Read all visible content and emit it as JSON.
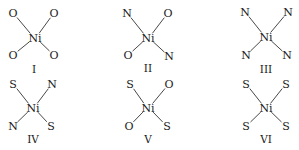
{
  "diagram": {
    "central_atom": "Ni",
    "complexes": [
      {
        "label": "I",
        "center": [
          35,
          38
        ],
        "ligands": {
          "top_left": "O",
          "top_right": "O",
          "bottom_left": "O",
          "bottom_right": "O"
        },
        "ligand_pos": {
          "top_left": [
            13,
            17
          ],
          "top_right": [
            54,
            17
          ],
          "bottom_left": [
            13,
            59
          ],
          "bottom_right": [
            54,
            59
          ]
        },
        "label_pos": [
          34,
          73
        ]
      },
      {
        "label": "II",
        "center": [
          148,
          38
        ],
        "ligands": {
          "top_left": "N",
          "top_right": "O",
          "bottom_left": "O",
          "bottom_right": "N"
        },
        "ligand_pos": {
          "top_left": [
            127,
            17
          ],
          "top_right": [
            168,
            17
          ],
          "bottom_left": [
            128,
            59
          ],
          "bottom_right": [
            169,
            60
          ]
        },
        "label_pos": [
          148,
          72
        ]
      },
      {
        "label": "III",
        "center": [
          266,
          37
        ],
        "ligands": {
          "top_left": "N",
          "top_right": "N",
          "bottom_left": "N",
          "bottom_right": "N"
        },
        "ligand_pos": {
          "top_left": [
            245,
            16
          ],
          "top_right": [
            288,
            16
          ],
          "bottom_left": [
            246,
            59
          ],
          "bottom_right": [
            287,
            59
          ]
        },
        "label_pos": [
          266,
          73
        ]
      },
      {
        "label": "IV",
        "center": [
          33,
          108
        ],
        "ligands": {
          "top_left": "S",
          "top_right": "N",
          "bottom_left": "N",
          "bottom_right": "S"
        },
        "ligand_pos": {
          "top_left": [
            13,
            88
          ],
          "top_right": [
            52,
            88
          ],
          "bottom_left": [
            13,
            130
          ],
          "bottom_right": [
            51,
            130
          ]
        },
        "label_pos": [
          33,
          143
        ]
      },
      {
        "label": "V",
        "center": [
          148,
          108
        ],
        "ligands": {
          "top_left": "S",
          "top_right": "O",
          "bottom_left": "O",
          "bottom_right": "S"
        },
        "ligand_pos": {
          "top_left": [
            130,
            88
          ],
          "top_right": [
            169,
            88
          ],
          "bottom_left": [
            129,
            130
          ],
          "bottom_right": [
            167,
            130
          ]
        },
        "label_pos": [
          148,
          143
        ]
      },
      {
        "label": "VI",
        "center": [
          266,
          108
        ],
        "ligands": {
          "top_left": "S",
          "top_right": "S",
          "bottom_left": "S",
          "bottom_right": "S"
        },
        "ligand_pos": {
          "top_left": [
            246,
            88
          ],
          "top_right": [
            286,
            88
          ],
          "bottom_left": [
            246,
            130
          ],
          "bottom_right": [
            286,
            130
          ]
        },
        "label_pos": [
          266,
          143
        ]
      }
    ]
  }
}
